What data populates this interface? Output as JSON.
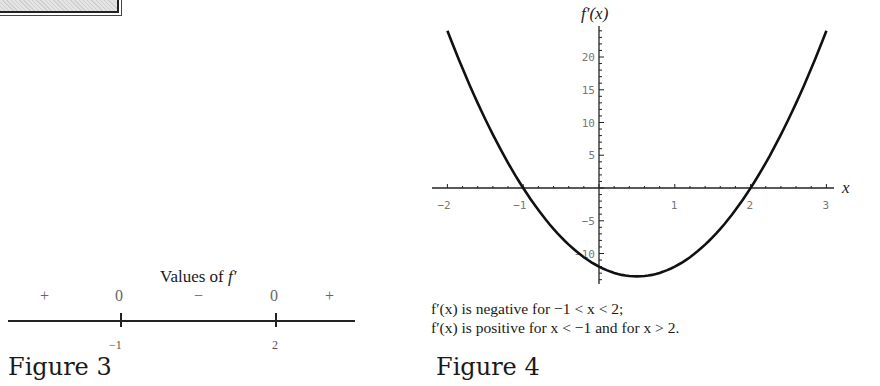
{
  "figure3": {
    "label": "Figure 3",
    "title_prefix": "Values of ",
    "title_fn": "f′",
    "signs": [
      "+",
      "0",
      "−",
      "0",
      "+"
    ],
    "tick_labels": [
      "−1",
      "2"
    ]
  },
  "figure4": {
    "label": "Figure 4",
    "y_axis_label": "f′(x)",
    "x_axis_label": "x",
    "caption_line1": "f′(x) is negative for −1 < x < 2;",
    "caption_line2": "f′(x) is positive for x < −1 and for x > 2."
  },
  "chart_data": [
    {
      "type": "table",
      "title": "Values of f′",
      "number_line": {
        "critical_points": [
          -1,
          2
        ]
      },
      "intervals": [
        {
          "interval": "x < -1",
          "sign": "+"
        },
        {
          "at": -1,
          "value": 0
        },
        {
          "interval": "-1 < x < 2",
          "sign": "-"
        },
        {
          "at": 2,
          "value": 0
        },
        {
          "interval": "x > 2",
          "sign": "+"
        }
      ]
    },
    {
      "type": "line",
      "title": "",
      "xlabel": "x",
      "ylabel": "f′(x)",
      "xlim": [
        -2,
        3
      ],
      "ylim": [
        -14,
        25
      ],
      "x_ticks": [
        -2,
        -1,
        1,
        2,
        3
      ],
      "y_ticks": [
        -10,
        -5,
        5,
        10,
        15,
        20
      ],
      "grid": false,
      "series": [
        {
          "name": "f′(x) = 6x² − 6x − 12",
          "x": [
            -2,
            -1.5,
            -1,
            -0.5,
            0,
            0.5,
            1,
            1.5,
            2,
            2.5,
            3
          ],
          "y": [
            24,
            10.5,
            0,
            -7.5,
            -12,
            -13.5,
            -12,
            -7.5,
            0,
            10.5,
            24
          ]
        }
      ],
      "annotations": [
        "f′(x) is negative for −1 < x < 2;",
        "f′(x) is positive for x < −1 and for x > 2."
      ]
    }
  ]
}
